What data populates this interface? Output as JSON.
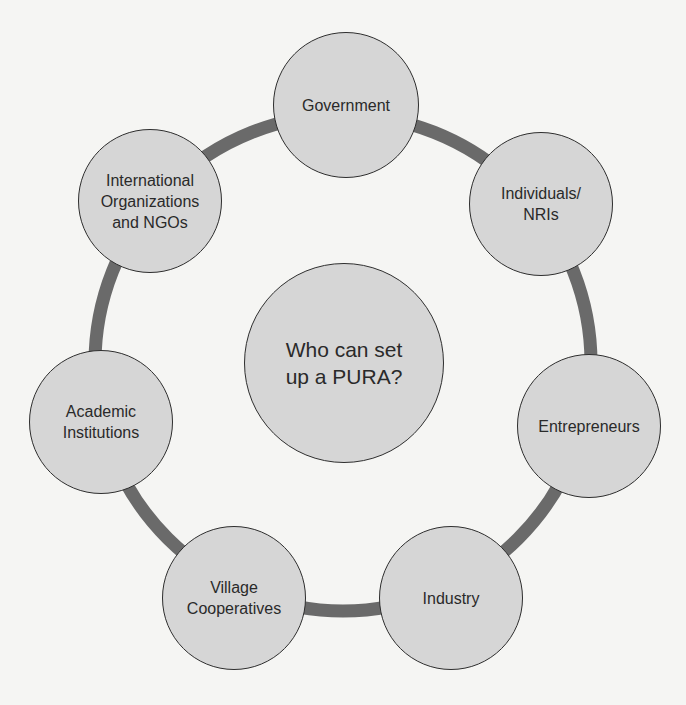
{
  "diagram": {
    "title": "Who can set up a PURA?",
    "center": {
      "label": "Who can set\nup a PURA?",
      "cx": 344,
      "cy": 363,
      "r": 100
    },
    "ring": {
      "cx": 343,
      "cy": 363,
      "r": 248,
      "stroke_width": 13,
      "color": "#6a6a6a"
    },
    "colors": {
      "background": "#f5f5f3",
      "node_fill": "#d6d6d6",
      "node_border": "#2e2e2e",
      "text": "#2a2a2a"
    },
    "nodes": [
      {
        "id": "government",
        "label": "Government",
        "cx": 346,
        "cy": 105,
        "r": 73
      },
      {
        "id": "individuals",
        "label": "Individuals/\nNRIs",
        "cx": 541,
        "cy": 204,
        "r": 72
      },
      {
        "id": "entrepreneurs",
        "label": "Entrepreneurs",
        "cx": 589,
        "cy": 426,
        "r": 72
      },
      {
        "id": "industry",
        "label": "Industry",
        "cx": 451,
        "cy": 598,
        "r": 72
      },
      {
        "id": "village-cooperatives",
        "label": "Village\nCooperatives",
        "cx": 234,
        "cy": 598,
        "r": 72
      },
      {
        "id": "academic-institutions",
        "label": "Academic\nInstitutions",
        "cx": 101,
        "cy": 422,
        "r": 72
      },
      {
        "id": "international-organizations",
        "label": "International\nOrganizations\nand NGOs",
        "cx": 150,
        "cy": 201,
        "r": 72
      }
    ]
  }
}
